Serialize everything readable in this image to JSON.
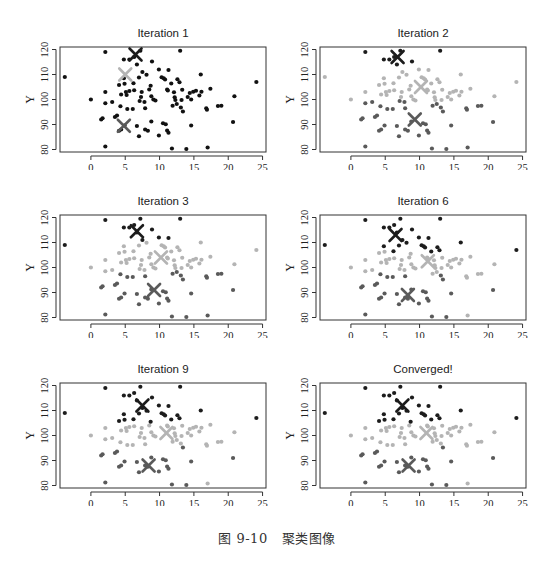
{
  "figure": {
    "caption_number": "图 9-10",
    "caption_text": "聚类图像"
  },
  "colors": {
    "cluster_top": "#1c1c1c",
    "cluster_mid": "#b4b4b4",
    "cluster_low": "#5a5a5a",
    "unassigned": "#111111",
    "frame": "#333333"
  },
  "chart_data": {
    "type": "scatter",
    "xlabel": "X",
    "ylabel": "Y",
    "xlim": [
      -4.5,
      25.5
    ],
    "ylim": [
      79,
      121
    ],
    "xticks": [
      0,
      5,
      10,
      15,
      20,
      25
    ],
    "yticks": [
      80,
      90,
      100,
      110,
      120
    ],
    "grid": false,
    "points": [
      [
        -3.8,
        109
      ],
      [
        0,
        100
      ],
      [
        2.1,
        119
      ],
      [
        2.1,
        103
      ],
      [
        2.1,
        98.5
      ],
      [
        1.5,
        92
      ],
      [
        1.7,
        92.5
      ],
      [
        2.1,
        81.2
      ],
      [
        3.1,
        99
      ],
      [
        3.5,
        93
      ],
      [
        3.8,
        93.6
      ],
      [
        4.1,
        105.8
      ],
      [
        4.4,
        102
      ],
      [
        4.3,
        97.3
      ],
      [
        4.1,
        87.5
      ],
      [
        4.4,
        88
      ],
      [
        4.8,
        116
      ],
      [
        4.9,
        106.3
      ],
      [
        4.8,
        108.5
      ],
      [
        5.1,
        103
      ],
      [
        5.2,
        101.8
      ],
      [
        5.3,
        96.2
      ],
      [
        4.9,
        89.6
      ],
      [
        5.6,
        103.4
      ],
      [
        5.6,
        116
      ],
      [
        6.2,
        106.5
      ],
      [
        6.3,
        117
      ],
      [
        6.3,
        103.7
      ],
      [
        6.1,
        96.2
      ],
      [
        6.7,
        114
      ],
      [
        6.7,
        89.4
      ],
      [
        7.2,
        119.5
      ],
      [
        7.0,
        108.8
      ],
      [
        7.3,
        101
      ],
      [
        7.1,
        99.4
      ],
      [
        7.5,
        111
      ],
      [
        7.4,
        103
      ],
      [
        7.0,
        85.3
      ],
      [
        7.8,
        99
      ],
      [
        7.9,
        96.5
      ],
      [
        8.1,
        109.9
      ],
      [
        7.9,
        88
      ],
      [
        8.3,
        87.5
      ],
      [
        8.5,
        104
      ],
      [
        8.7,
        105.5
      ],
      [
        8.9,
        115.2
      ],
      [
        8.8,
        101.3
      ],
      [
        8.8,
        91.2
      ],
      [
        9.1,
        100
      ],
      [
        9.4,
        99.6
      ],
      [
        9.9,
        112
      ],
      [
        9.9,
        85.6
      ],
      [
        10.3,
        108.9
      ],
      [
        10.6,
        108.5
      ],
      [
        10.8,
        108
      ],
      [
        10.5,
        90.5
      ],
      [
        10.9,
        90.1
      ],
      [
        11.1,
        104
      ],
      [
        11.3,
        111.8
      ],
      [
        11.2,
        103.6
      ],
      [
        11.1,
        87.6
      ],
      [
        11.3,
        86.7
      ],
      [
        11.7,
        106.4
      ],
      [
        11.9,
        97.5
      ],
      [
        11.8,
        80.4
      ],
      [
        12.1,
        102.9
      ],
      [
        12.3,
        99.8
      ],
      [
        12.5,
        98.2
      ],
      [
        12.2,
        100.9
      ],
      [
        12.6,
        108.1
      ],
      [
        12.9,
        106.9
      ],
      [
        13,
        119.5
      ],
      [
        13.2,
        99.8
      ],
      [
        13.1,
        96.8
      ],
      [
        13.4,
        95.2
      ],
      [
        13.3,
        103.9
      ],
      [
        13.9,
        80.2
      ],
      [
        14.1,
        101
      ],
      [
        14.4,
        102.6
      ],
      [
        14.6,
        100
      ],
      [
        14.6,
        89.6
      ],
      [
        14.9,
        103.1
      ],
      [
        15.3,
        103.5
      ],
      [
        15.8,
        101.6
      ],
      [
        16.0,
        110
      ],
      [
        16.1,
        103.1
      ],
      [
        16.8,
        96.5
      ],
      [
        16.9,
        95.9
      ],
      [
        17.0,
        80.8
      ],
      [
        17.4,
        104.3
      ],
      [
        18.5,
        97.4
      ],
      [
        19.0,
        97.5
      ],
      [
        20.7,
        91
      ],
      [
        20.9,
        101.3
      ],
      [
        24.1,
        107
      ]
    ],
    "series": [
      {
        "name": "Iteration 1",
        "labels": "all-unassigned",
        "centroids": [
          {
            "cluster": "top",
            "x": 6.5,
            "y": 118
          },
          {
            "cluster": "mid",
            "x": 5.0,
            "y": 110
          },
          {
            "cluster": "low",
            "x": 4.8,
            "y": 89.5
          }
        ]
      },
      {
        "name": "Iteration 2",
        "rule": {
          "top_min_y": 113.5,
          "low_max_y": 99.5,
          "low_max_x": 21.5,
          "extra_top": [],
          "extra_mid": [
            0,
            1,
            3,
            94
          ],
          "extra_low": []
        },
        "centroids": [
          {
            "cluster": "top",
            "x": 6.8,
            "y": 117
          },
          {
            "cluster": "mid",
            "x": 10.2,
            "y": 105
          },
          {
            "cluster": "low",
            "x": 9.3,
            "y": 92
          }
        ]
      },
      {
        "name": "Iteration 3",
        "rule": {
          "top_min_y": 110.5,
          "low_max_y": 98.3,
          "low_max_x": 21.5,
          "extra_top": [
            0
          ],
          "extra_mid": [
            1,
            3
          ],
          "extra_low": []
        },
        "centroids": [
          {
            "cluster": "top",
            "x": 6.7,
            "y": 114.5
          },
          {
            "cluster": "mid",
            "x": 10.2,
            "y": 104
          },
          {
            "cluster": "low",
            "x": 9.2,
            "y": 91
          }
        ]
      },
      {
        "name": "Iteration 6",
        "rule": {
          "top_min_y": 106.4,
          "low_max_y": 97.4,
          "low_max_x": 15.0,
          "extra_top": [
            0,
            94
          ],
          "extra_mid": [
            1,
            3,
            4
          ],
          "extra_low": [
            92
          ]
        },
        "centroids": [
          {
            "cluster": "top",
            "x": 6.5,
            "y": 113
          },
          {
            "cluster": "mid",
            "x": 11.2,
            "y": 102.5
          },
          {
            "cluster": "low",
            "x": 8.3,
            "y": 89
          }
        ]
      },
      {
        "name": "Iteration 9",
        "rule": {
          "top_min_y": 105.5,
          "low_max_y": 95.5,
          "low_max_x": 15.0,
          "extra_top": [
            0,
            84
          ],
          "extra_mid": [
            1,
            3,
            4
          ],
          "extra_low": [
            92
          ]
        },
        "centroids": [
          {
            "cluster": "top",
            "x": 7.5,
            "y": 112
          },
          {
            "cluster": "mid",
            "x": 11.0,
            "y": 101
          },
          {
            "cluster": "low",
            "x": 8.4,
            "y": 88
          }
        ]
      },
      {
        "name": "Converged!",
        "rule": {
          "top_min_y": 105.5,
          "low_max_y": 95.5,
          "low_max_x": 15.0,
          "extra_top": [
            0,
            84
          ],
          "extra_mid": [
            1,
            3,
            4
          ],
          "extra_low": [
            92
          ]
        },
        "centroids": [
          {
            "cluster": "top",
            "x": 7.5,
            "y": 112
          },
          {
            "cluster": "mid",
            "x": 11.0,
            "y": 101
          },
          {
            "cluster": "low",
            "x": 8.4,
            "y": 88
          }
        ]
      }
    ]
  }
}
